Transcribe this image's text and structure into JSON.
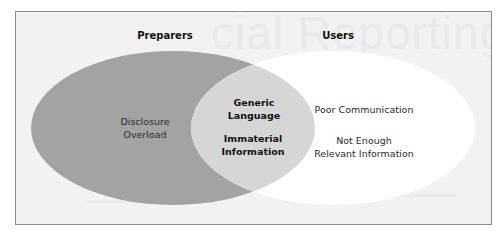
{
  "diagram": {
    "type": "venn",
    "sets": [
      {
        "name": "Preparers",
        "color": "#a3a3a3",
        "exclusive_items": [
          "Disclosure Overload"
        ]
      },
      {
        "name": "Users",
        "color": "#ffffff",
        "exclusive_items": [
          "Poor Communication",
          "Not Enough Relevant Information"
        ]
      }
    ],
    "intersection": {
      "color": "#d6d6d6",
      "items": [
        "Generic Language",
        "Immaterial Information"
      ]
    }
  },
  "labels": {
    "preparers_title": "Preparers",
    "users_title": "Users",
    "disclosure_line1": "Disclosure",
    "disclosure_line2": "Overload",
    "generic_line1": "Generic",
    "generic_line2": "Language",
    "immaterial_line1": "Immaterial",
    "immaterial_line2": "Information",
    "poor_communication": "Poor Communication",
    "not_enough_line1": "Not Enough",
    "not_enough_line2": "Relevant Information"
  },
  "background": {
    "watermark_text": "cial Reporting"
  },
  "colors": {
    "frame_border": "#8a8a8a",
    "frame_background": "#f2f2f2",
    "preparers_fill": "#a3a3a3",
    "users_fill": "#ffffff",
    "intersection_fill": "#d6d6d6",
    "text": "#2b2b2b"
  }
}
